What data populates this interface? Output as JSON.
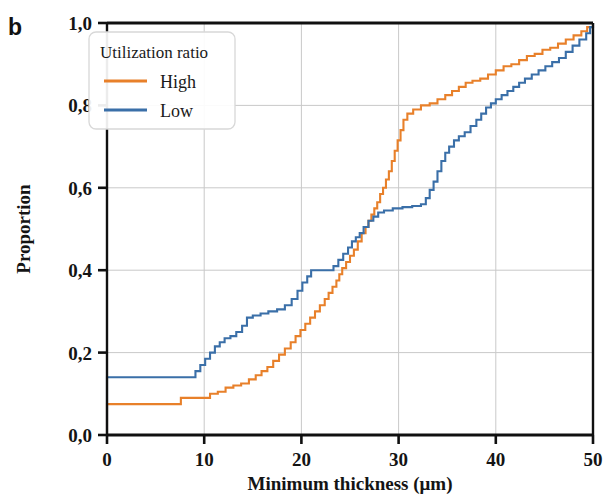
{
  "figure": {
    "panel_label": "b",
    "background": "#ffffff"
  },
  "chart_data": {
    "type": "line",
    "subtype": "empirical-cumulative-distribution-step",
    "title": "",
    "xlabel": "Minimum thickness (μm)",
    "ylabel": "Proportion",
    "xlim": [
      0,
      50
    ],
    "ylim": [
      0.0,
      1.0
    ],
    "xticks": [
      0,
      10,
      20,
      30,
      40,
      50
    ],
    "xticklabels": [
      "0",
      "10",
      "20",
      "30",
      "40",
      "50"
    ],
    "yticks": [
      0.0,
      0.2,
      0.4,
      0.6,
      0.8,
      1.0
    ],
    "yticklabels": [
      "0,0",
      "0,2",
      "0,4",
      "0,6",
      "0,8",
      "1,0"
    ],
    "grid": true,
    "grid_color": "#c9c9c9",
    "decimal_separator": ",",
    "legend": {
      "title": "Utilization ratio",
      "position": "upper-left",
      "entries": [
        {
          "label": "High",
          "color": "#e8802a"
        },
        {
          "label": "Low",
          "color": "#3a6fa8"
        }
      ]
    },
    "series": [
      {
        "name": "High",
        "color": "#e8802a",
        "points": [
          [
            0.0,
            0.0
          ],
          [
            0.0,
            0.075
          ],
          [
            7.4,
            0.075
          ],
          [
            7.6,
            0.09
          ],
          [
            10.3,
            0.09
          ],
          [
            10.6,
            0.1
          ],
          [
            11.4,
            0.105
          ],
          [
            12.2,
            0.115
          ],
          [
            13.0,
            0.12
          ],
          [
            13.8,
            0.125
          ],
          [
            14.6,
            0.135
          ],
          [
            15.3,
            0.145
          ],
          [
            15.9,
            0.155
          ],
          [
            16.5,
            0.165
          ],
          [
            17.1,
            0.18
          ],
          [
            17.7,
            0.195
          ],
          [
            18.3,
            0.21
          ],
          [
            18.9,
            0.225
          ],
          [
            19.4,
            0.24
          ],
          [
            19.9,
            0.255
          ],
          [
            20.4,
            0.27
          ],
          [
            20.9,
            0.285
          ],
          [
            21.4,
            0.3
          ],
          [
            21.9,
            0.315
          ],
          [
            22.4,
            0.33
          ],
          [
            22.8,
            0.345
          ],
          [
            23.2,
            0.36
          ],
          [
            23.6,
            0.375
          ],
          [
            23.9,
            0.39
          ],
          [
            24.2,
            0.405
          ],
          [
            24.6,
            0.42
          ],
          [
            25.0,
            0.435
          ],
          [
            25.4,
            0.45
          ],
          [
            25.8,
            0.47
          ],
          [
            26.2,
            0.49
          ],
          [
            26.6,
            0.505
          ],
          [
            26.9,
            0.52
          ],
          [
            27.2,
            0.535
          ],
          [
            27.5,
            0.55
          ],
          [
            27.8,
            0.565
          ],
          [
            28.1,
            0.585
          ],
          [
            28.4,
            0.6
          ],
          [
            28.7,
            0.62
          ],
          [
            29.0,
            0.64
          ],
          [
            29.3,
            0.665
          ],
          [
            29.6,
            0.69
          ],
          [
            29.9,
            0.715
          ],
          [
            30.2,
            0.74
          ],
          [
            30.5,
            0.765
          ],
          [
            30.9,
            0.78
          ],
          [
            31.5,
            0.79
          ],
          [
            32.3,
            0.8
          ],
          [
            33.2,
            0.805
          ],
          [
            34.0,
            0.815
          ],
          [
            34.8,
            0.825
          ],
          [
            35.5,
            0.835
          ],
          [
            36.2,
            0.845
          ],
          [
            36.9,
            0.855
          ],
          [
            37.6,
            0.86
          ],
          [
            38.4,
            0.865
          ],
          [
            39.2,
            0.875
          ],
          [
            40.0,
            0.885
          ],
          [
            40.8,
            0.895
          ],
          [
            41.6,
            0.9
          ],
          [
            42.4,
            0.91
          ],
          [
            43.2,
            0.92
          ],
          [
            44.0,
            0.925
          ],
          [
            44.8,
            0.935
          ],
          [
            45.6,
            0.94
          ],
          [
            46.4,
            0.95
          ],
          [
            47.2,
            0.96
          ],
          [
            48.0,
            0.97
          ],
          [
            48.8,
            0.98
          ],
          [
            49.4,
            0.99
          ],
          [
            50.0,
            1.0
          ]
        ]
      },
      {
        "name": "Low",
        "color": "#3a6fa8",
        "points": [
          [
            0.0,
            0.0
          ],
          [
            0.0,
            0.14
          ],
          [
            8.9,
            0.14
          ],
          [
            9.1,
            0.155
          ],
          [
            9.6,
            0.17
          ],
          [
            10.1,
            0.185
          ],
          [
            10.6,
            0.2
          ],
          [
            11.1,
            0.215
          ],
          [
            11.6,
            0.225
          ],
          [
            12.1,
            0.235
          ],
          [
            12.7,
            0.24
          ],
          [
            13.3,
            0.25
          ],
          [
            13.9,
            0.265
          ],
          [
            14.4,
            0.285
          ],
          [
            15.0,
            0.29
          ],
          [
            15.8,
            0.295
          ],
          [
            16.6,
            0.3
          ],
          [
            17.5,
            0.305
          ],
          [
            18.3,
            0.315
          ],
          [
            19.0,
            0.33
          ],
          [
            19.6,
            0.35
          ],
          [
            20.1,
            0.37
          ],
          [
            20.6,
            0.385
          ],
          [
            21.0,
            0.4
          ],
          [
            22.8,
            0.4
          ],
          [
            23.3,
            0.41
          ],
          [
            23.8,
            0.425
          ],
          [
            24.3,
            0.44
          ],
          [
            24.8,
            0.455
          ],
          [
            25.2,
            0.47
          ],
          [
            25.6,
            0.48
          ],
          [
            26.0,
            0.49
          ],
          [
            26.4,
            0.505
          ],
          [
            26.9,
            0.52
          ],
          [
            27.4,
            0.53
          ],
          [
            27.9,
            0.54
          ],
          [
            28.5,
            0.545
          ],
          [
            29.4,
            0.55
          ],
          [
            30.4,
            0.553
          ],
          [
            31.4,
            0.556
          ],
          [
            32.3,
            0.56
          ],
          [
            32.8,
            0.575
          ],
          [
            33.2,
            0.595
          ],
          [
            33.6,
            0.615
          ],
          [
            34.0,
            0.64
          ],
          [
            34.4,
            0.665
          ],
          [
            34.8,
            0.685
          ],
          [
            35.2,
            0.7
          ],
          [
            35.7,
            0.715
          ],
          [
            36.2,
            0.725
          ],
          [
            36.8,
            0.735
          ],
          [
            37.4,
            0.75
          ],
          [
            38.0,
            0.765
          ],
          [
            38.5,
            0.78
          ],
          [
            39.0,
            0.795
          ],
          [
            39.5,
            0.805
          ],
          [
            40.0,
            0.815
          ],
          [
            40.6,
            0.825
          ],
          [
            41.2,
            0.835
          ],
          [
            41.8,
            0.845
          ],
          [
            42.4,
            0.855
          ],
          [
            43.0,
            0.865
          ],
          [
            43.7,
            0.875
          ],
          [
            44.4,
            0.885
          ],
          [
            45.1,
            0.895
          ],
          [
            45.8,
            0.905
          ],
          [
            46.5,
            0.915
          ],
          [
            47.2,
            0.93
          ],
          [
            47.9,
            0.945
          ],
          [
            48.6,
            0.96
          ],
          [
            49.3,
            0.975
          ],
          [
            49.7,
            0.99
          ],
          [
            50.0,
            1.0
          ]
        ]
      }
    ]
  }
}
